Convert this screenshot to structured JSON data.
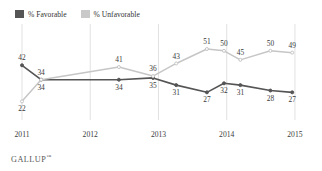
{
  "chart_data": {
    "type": "line",
    "title": "",
    "subtitle": "",
    "xlabel": "",
    "ylabel": "",
    "grid": "vertical",
    "legend_position": "top-left",
    "ylim": [
      15,
      56
    ],
    "xlim": [
      2011.0,
      2015.25
    ],
    "x_tick_labels": [
      "2011",
      "2012",
      "2013",
      "2014",
      "2015"
    ],
    "x_tick_values": [
      2011,
      2012,
      2013,
      2014,
      2015
    ],
    "x": [
      2011.0,
      2011.28,
      2012.42,
      2012.92,
      2013.26,
      2013.71,
      2013.96,
      2014.2,
      2014.64,
      2014.96
    ],
    "series": [
      {
        "name": "% Favorable",
        "color": "#555555",
        "values": [
          42,
          34,
          34,
          35,
          31,
          27,
          32,
          31,
          28,
          27
        ],
        "labels": [
          "42",
          "34",
          "34",
          "35",
          "31",
          "27",
          "32",
          "31",
          "28",
          "27"
        ]
      },
      {
        "name": "% Unfavorable",
        "color": "#c6c6c6",
        "values": [
          22,
          34,
          41,
          36,
          43,
          51,
          50,
          45,
          50,
          49
        ],
        "labels": [
          "22",
          "34",
          "41",
          "36",
          "43",
          "51",
          "50",
          "45",
          "50",
          "49"
        ]
      }
    ]
  },
  "legend": {
    "items": [
      {
        "label": "% Favorable",
        "color": "#555555"
      },
      {
        "label": "% Unfavorable",
        "color": "#c9c9c9"
      }
    ]
  },
  "footer": {
    "source": "GALLUP",
    "trademark": "™"
  }
}
